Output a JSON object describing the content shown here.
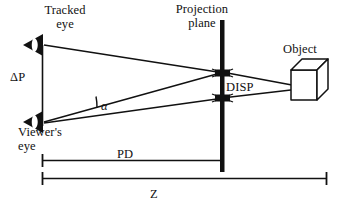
{
  "figure": {
    "type": "optical-projection-geometry-diagram",
    "background_color": "#ffffff",
    "stroke_color": "#111111",
    "labels": {
      "tracked_eye": "Tracked\neye",
      "viewers_eye": "Viewer's\neye",
      "delta_p": "ΔP",
      "projection_plane": "Projection\nplane",
      "disp": "DISP",
      "object": "Object",
      "alpha": "α",
      "pd": "PD",
      "z": "Z"
    },
    "icons": {
      "tracked_eye_icon": "eye-frustum-icon",
      "viewers_eye_icon": "eye-frustum-icon",
      "object_icon": "cube-icon",
      "plane_icon": "vertical-plane-bar",
      "angle_icon": "angle-arc",
      "pd_dimension_icon": "dimension-line",
      "z_dimension_icon": "dimension-line"
    },
    "geometry": {
      "tracked_eye_point": [
        42,
        45
      ],
      "viewers_eye_point": [
        42,
        122
      ],
      "projection_plane_x": 222,
      "projection_plane_y_range": [
        20,
        172
      ],
      "upper_intersection": [
        222,
        73
      ],
      "lower_intersection": [
        222,
        98
      ],
      "object_point": [
        307,
        88
      ],
      "delta_p_line_x": 42,
      "delta_p_line_y_range": [
        45,
        125
      ],
      "pd_line_y": 160,
      "pd_line_x_range": [
        42,
        222
      ],
      "z_line_y": 178,
      "z_line_x_range": [
        42,
        327
      ]
    }
  }
}
